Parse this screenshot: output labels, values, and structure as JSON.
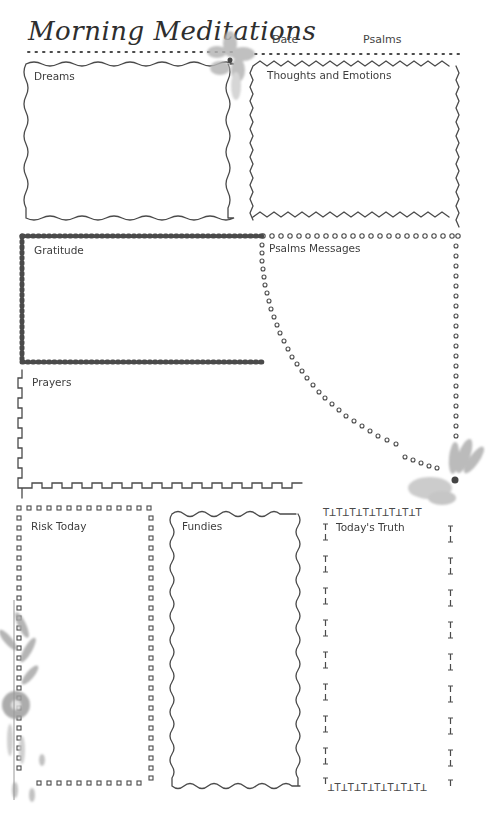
{
  "page": {
    "title": "Morning Meditations",
    "header_fields": [
      {
        "label": "Date"
      },
      {
        "label": "Psalms"
      }
    ]
  },
  "sections": {
    "dreams": {
      "label": "Dreams"
    },
    "thoughts": {
      "label": "Thoughts and Emotions"
    },
    "gratitude": {
      "label": "Gratitude"
    },
    "psalms_messages": {
      "label": "Psalms Messages"
    },
    "prayers": {
      "label": "Prayers"
    },
    "risk_today": {
      "label": "Risk Today"
    },
    "fundies": {
      "label": "Fundies"
    },
    "todays_truth": {
      "label": "Today's Truth"
    }
  },
  "decorations": {
    "flowers": [
      "watercolor-flower-top",
      "watercolor-flower-right",
      "watercolor-flower-spray-left"
    ],
    "ink_color": "#4a4a4a",
    "flower_color": "#9a9a9a"
  }
}
